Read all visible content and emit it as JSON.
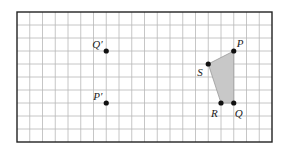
{
  "grid": {
    "columns": 20,
    "rows": 10,
    "origin_px": [
      17,
      12
    ],
    "cell_w": 12.75,
    "cell_h": 13,
    "line_color": "#b8b8b8",
    "border_color": "#222222"
  },
  "shape": {
    "name": "quadrilateral PQRS",
    "fill": "#c8c8c8",
    "stroke": "#9a9a9a",
    "vertices": [
      "P",
      "Q",
      "R",
      "S"
    ]
  },
  "points": [
    {
      "id": "P",
      "label": "P",
      "col": 17,
      "row": 3,
      "label_dx": 3,
      "label_dy": -4
    },
    {
      "id": "Q",
      "label": "Q",
      "col": 17,
      "row": 7,
      "label_dx": 1,
      "label_dy": 14
    },
    {
      "id": "R",
      "label": "R",
      "col": 16,
      "row": 7,
      "label_dx": -10,
      "label_dy": 14
    },
    {
      "id": "S",
      "label": "S",
      "col": 15,
      "row": 4,
      "label_dx": -11,
      "label_dy": 12
    },
    {
      "id": "Qp",
      "label": "Q′",
      "col": 7,
      "row": 3,
      "label_dx": -14,
      "label_dy": -3
    },
    {
      "id": "Pp",
      "label": "P′",
      "col": 7,
      "row": 7,
      "label_dx": -13,
      "label_dy": -3
    }
  ]
}
